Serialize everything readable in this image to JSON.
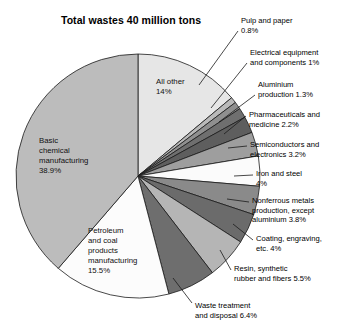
{
  "chart_data": {
    "type": "pie",
    "title": "Total wastes 40 million tons",
    "total_label": "40 million tons",
    "units": "percent of total wastes",
    "start_angle_deg": -90,
    "direction": "clockwise",
    "grid": false,
    "legend": "none (direct labels with leader lines)",
    "categories": [
      "All other",
      "Pulp and paper",
      "Electrical equipment and components",
      "Aluminium production",
      "Pharmaceuticals and medicine",
      "Semiconductors and electronics",
      "Iron and steel",
      "Nonferrous metals production, except aluminium",
      "Coating, engraving, etc.",
      "Resin, synthetic rubber and fibers",
      "Waste treatment and disposal",
      "Petroleum and coal products manufacturing",
      "Basic chemical manufacturing"
    ],
    "values": [
      14,
      0.8,
      1,
      1.3,
      2.2,
      3.2,
      4,
      3.8,
      4,
      5.5,
      6.4,
      15.5,
      38.9
    ],
    "value_labels": [
      "14%",
      "0.8%",
      "1%",
      "1.3%",
      "2.2%",
      "3.2%",
      "4%",
      "3.8%",
      "4%",
      "5.5%",
      "6.4%",
      "15.5%",
      "38.9%"
    ],
    "slice_colors": [
      "#e6e6e6",
      "#b9b9b9",
      "#8f8f8f",
      "#6f6f6f",
      "#5e5e5e",
      "#9e9e9e",
      "#fbfbfb",
      "#8a8a8a",
      "#6b6b6b",
      "#b5b5b5",
      "#6e6e6e",
      "#fcfcfc",
      "#bcbcbc"
    ],
    "slices": [
      {
        "label": "All other",
        "value": 14,
        "value_text": "14%",
        "color": "#e6e6e6",
        "label_mode": "inside"
      },
      {
        "label": "Pulp and paper",
        "value": 0.8,
        "value_text": "0.8%",
        "color": "#b9b9b9",
        "label_mode": "callout"
      },
      {
        "label": "Electrical equipment and components",
        "value": 1,
        "value_text": "1%",
        "color": "#8f8f8f",
        "label_mode": "callout"
      },
      {
        "label": "Aluminium production",
        "value": 1.3,
        "value_text": "1.3%",
        "color": "#6f6f6f",
        "label_mode": "callout"
      },
      {
        "label": "Pharmaceuticals and medicine",
        "value": 2.2,
        "value_text": "2.2%",
        "color": "#5e5e5e",
        "label_mode": "callout"
      },
      {
        "label": "Semiconductors and electronics",
        "value": 3.2,
        "value_text": "3.2%",
        "color": "#9e9e9e",
        "label_mode": "callout"
      },
      {
        "label": "Iron and steel",
        "value": 4,
        "value_text": "4%",
        "color": "#fbfbfb",
        "label_mode": "callout"
      },
      {
        "label": "Nonferrous metals production, except aluminium",
        "value": 3.8,
        "value_text": "3.8%",
        "color": "#8a8a8a",
        "label_mode": "callout"
      },
      {
        "label": "Coating, engraving, etc.",
        "value": 4,
        "value_text": "4%",
        "color": "#6b6b6b",
        "label_mode": "callout"
      },
      {
        "label": "Resin, synthetic rubber and fibers",
        "value": 5.5,
        "value_text": "5.5%",
        "color": "#b5b5b5",
        "label_mode": "callout"
      },
      {
        "label": "Waste treatment and disposal",
        "value": 6.4,
        "value_text": "6.4%",
        "color": "#6e6e6e",
        "label_mode": "callout"
      },
      {
        "label": "Petroleum and coal products manufacturing",
        "value": 15.5,
        "value_text": "15.5%",
        "color": "#fcfcfc",
        "label_mode": "inside"
      },
      {
        "label": "Basic chemical manufacturing",
        "value": 38.9,
        "value_text": "38.9%",
        "color": "#bcbcbc",
        "label_mode": "inside"
      }
    ]
  },
  "geometry": {
    "center_x": 138,
    "center_y": 176,
    "radius": 122,
    "outline_color": "#1a1a1a",
    "outline_width": 0.8,
    "leader_color": "#1a1a1a"
  },
  "inside_labels": [
    {
      "name": "all-other",
      "lines": [
        "All other",
        "14%"
      ],
      "x": 156,
      "y": 77
    },
    {
      "name": "basic-chemical-manufacturing",
      "lines": [
        "Basic",
        "chemical",
        "manufacturing",
        "38.9%"
      ],
      "x": 39,
      "y": 136
    },
    {
      "name": "petroleum-and-coal",
      "lines": [
        "Petroleum",
        "and coal",
        "products",
        "manufacturing",
        "15.5%"
      ],
      "x": 88,
      "y": 226
    }
  ],
  "callout_labels": [
    {
      "name": "pulp-and-paper",
      "lines": [
        "Pulp and paper",
        "0.8%"
      ],
      "x": 241,
      "y": 16,
      "leader": [
        [
          238,
          31
        ],
        [
          199,
          85
        ]
      ]
    },
    {
      "name": "electrical-equipment-and-components",
      "lines": [
        "Electrical equipment",
        "and components 1%"
      ],
      "x": 250,
      "y": 48,
      "leader": [
        [
          247,
          63
        ],
        [
          211,
          108
        ]
      ]
    },
    {
      "name": "aluminium-production",
      "lines": [
        "Aluminium",
        "production 1.3%"
      ],
      "x": 258,
      "y": 80,
      "leader": [
        [
          255,
          95
        ],
        [
          219,
          122
        ]
      ]
    },
    {
      "name": "pharmaceuticals-and-medicine",
      "lines": [
        "Pharmaceuticals and",
        "medicine 2.2%"
      ],
      "x": 249,
      "y": 110,
      "leader": [
        [
          246,
          116
        ],
        [
          224,
          134
        ]
      ]
    },
    {
      "name": "semiconductors-and-electronics",
      "lines": [
        "Semiconductors and",
        "electronics 3.2%"
      ],
      "x": 250,
      "y": 140,
      "leader": [
        [
          247,
          146
        ],
        [
          228,
          148
        ]
      ]
    },
    {
      "name": "iron-and-steel",
      "lines": [
        "Iron and steel",
        "4%"
      ],
      "x": 256,
      "y": 169,
      "leader": [
        [
          253,
          175
        ],
        [
          234,
          176
        ]
      ]
    },
    {
      "name": "nonferrous-metals-production",
      "lines": [
        "Nonferrous metals",
        "production, except",
        "aluminium 3.8%"
      ],
      "x": 252,
      "y": 196,
      "leader": [
        [
          249,
          202
        ],
        [
          227,
          199
        ]
      ]
    },
    {
      "name": "coating-engraving",
      "lines": [
        "Coating, engraving,",
        "etc. 4%"
      ],
      "x": 256,
      "y": 234,
      "leader": [
        [
          253,
          240
        ],
        [
          233,
          224
        ]
      ]
    },
    {
      "name": "resin-synthetic-rubber-and-fibers",
      "lines": [
        "Resin, synthetic",
        "rubber and fibers 5.5%"
      ],
      "x": 234,
      "y": 264,
      "leader": [
        [
          231,
          270
        ],
        [
          220,
          250
        ]
      ]
    },
    {
      "name": "waste-treatment-and-disposal",
      "lines": [
        "Waste treatment",
        "and disposal 6.4%"
      ],
      "x": 195,
      "y": 301,
      "leader": [
        [
          192,
          303
        ],
        [
          173,
          278
        ]
      ]
    }
  ]
}
